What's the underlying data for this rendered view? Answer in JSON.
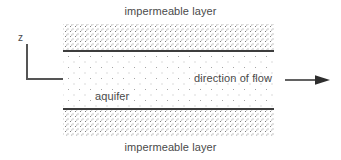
{
  "diagram": {
    "title_top": "impermeable layer",
    "title_bottom": "impermeable layer",
    "aquifer_label": "aquifer",
    "flow_label": "direction of flow",
    "axis": {
      "vertical_letter": "z",
      "horizontal_letter": "x"
    },
    "colors": {
      "background": "#ffffff",
      "text": "#4a4a4a",
      "boundary_line": "#3d3d3d",
      "axis_line": "#555555",
      "stipple_dense": "#8d8d8d",
      "stipple_sparse": "#a5a5a5",
      "arrow": "#2e2e2e"
    },
    "icons": {
      "flow_arrow": "arrow-right-icon"
    }
  }
}
